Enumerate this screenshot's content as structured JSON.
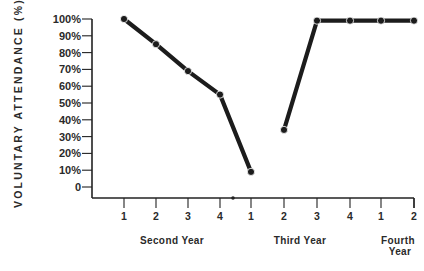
{
  "chart_data": {
    "type": "line",
    "title": "",
    "xlabel": "",
    "ylabel": "VOLUNTARY ATTENDANCE (%)",
    "ylim": [
      0,
      100
    ],
    "y_ticks": [
      "0",
      "10%",
      "20%",
      "30%",
      "40%",
      "50%",
      "60%",
      "70%",
      "80%",
      "90%",
      "100%"
    ],
    "grid": false,
    "legend": null,
    "categories": [
      "1",
      "2",
      "3",
      "4",
      "1",
      "2",
      "3",
      "4",
      "1",
      "2"
    ],
    "groups": [
      {
        "label": "Second Year",
        "quarters": [
          "1",
          "2",
          "3",
          "4"
        ]
      },
      {
        "label": "Third Year",
        "quarters": [
          "1",
          "2",
          "3",
          "4"
        ]
      },
      {
        "label": "Fourth Year",
        "quarters": [
          "1",
          "2"
        ]
      }
    ],
    "series": [
      {
        "name": "Voluntary attendance",
        "segments": [
          {
            "points": [
              [
                0,
                100
              ],
              [
                1,
                85
              ],
              [
                2,
                69
              ],
              [
                3,
                55
              ],
              [
                4,
                9
              ]
            ]
          },
          {
            "points": [
              [
                5,
                34
              ],
              [
                6,
                99
              ],
              [
                7,
                99
              ],
              [
                8,
                99
              ],
              [
                9,
                99
              ]
            ]
          }
        ],
        "values": [
          100,
          85,
          69,
          55,
          9,
          34,
          99,
          99,
          99,
          99
        ]
      }
    ],
    "annotations": [
      "year break marker dot on x-axis between Second Year Q4 and Third Year Q1"
    ]
  }
}
